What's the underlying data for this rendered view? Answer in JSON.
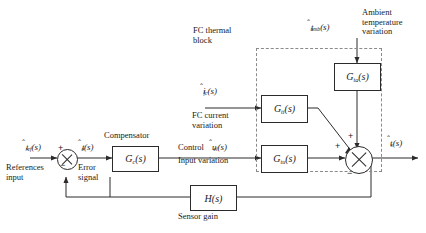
{
  "figure": {
    "type": "control-block-diagram",
    "title_visible": false
  },
  "signals": {
    "reference": "t̂ref(s)",
    "reference_base": "t",
    "reference_sub": "ref",
    "error": "t̂e(s)",
    "error_base": "t",
    "error_sub": "e",
    "control": "ûcl(s)",
    "control_base": "u",
    "control_sub": "cl",
    "fc_current": "îfc(s)",
    "fc_current_base": "i",
    "fc_current_sub": "fc",
    "ambient": "t̂amb(s)",
    "ambient_base": "t",
    "ambient_sub": "amb",
    "output": "t̂s(s)",
    "output_base": "t",
    "output_sub": "s"
  },
  "blocks": {
    "compensator": {
      "label_base": "G",
      "label_sub": "c",
      "label_tail": "(s)",
      "caption": "Compensator"
    },
    "g_ti": {
      "label_base": "G",
      "label_sub": "ti",
      "label_tail": "(s)"
    },
    "g_tu": {
      "label_base": "G",
      "label_sub": "tu",
      "label_tail": "(s)"
    },
    "g_ta": {
      "label_base": "G",
      "label_sub": "ta",
      "label_tail": "(s)"
    },
    "sensor": {
      "label_base": "H",
      "label_tail": "(s)",
      "caption": "Sensor gain"
    }
  },
  "annotations": {
    "fc_thermal_block_line1": "FC thermal",
    "fc_thermal_block_line2": "block",
    "ambient_line1": "Ambient",
    "ambient_line2": "temperature",
    "ambient_line3": "variation",
    "fc_current_line1": "FC current",
    "fc_current_line2": "variation",
    "control_line1": "Control",
    "control_line2": "Input variation",
    "references_line1": "References",
    "references_line2": "input",
    "error_line1": "Error",
    "error_line2": "signal"
  },
  "summing_junctions": {
    "input_junction": {
      "plus": "+",
      "minus": "−"
    },
    "output_junction": {
      "plus_left": "+",
      "plus_top": "+",
      "minus_bottom": "−"
    }
  },
  "colors": {
    "line": "#2b2b2b",
    "dashed": "#8a8a8a",
    "background": "#ffffff",
    "text": "#1a1a1a"
  }
}
